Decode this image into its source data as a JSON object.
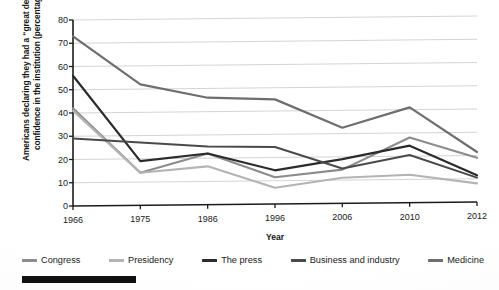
{
  "chart_data": {
    "type": "line",
    "title": "",
    "xlabel": "Year",
    "ylabel": "Americans declaring they had a “great deal” of confidence in the institution (percentage)",
    "categories": [
      "1966",
      "1975",
      "1986",
      "1996",
      "2006",
      "2010",
      "2012"
    ],
    "ylim": [
      0,
      80
    ],
    "ytick_labels": [
      "0",
      "10",
      "20",
      "30",
      "40",
      "50",
      "60",
      "70",
      "80"
    ],
    "yticks": [
      0,
      10,
      20,
      30,
      40,
      50,
      60,
      70,
      80
    ],
    "grid": "horizontal",
    "legend_position": "bottom",
    "series": [
      {
        "name": "Congress",
        "color": "#8c8c8c",
        "values": [
          42,
          14,
          22,
          11.5,
          14.5,
          28,
          19
        ]
      },
      {
        "name": "Presidency",
        "color": "#b4b4b4",
        "values": [
          41,
          14,
          16.5,
          7,
          11,
          12,
          8
        ]
      },
      {
        "name": "The press",
        "color": "#2b2b2b",
        "values": [
          56,
          19,
          22,
          14.5,
          19,
          24.5,
          11.5
        ]
      },
      {
        "name": "Business and industry",
        "color": "#4a4a4a",
        "values": [
          29,
          27,
          25,
          24.5,
          15,
          20.5,
          10.5
        ]
      },
      {
        "name": "Medicine",
        "color": "#6e6e6e",
        "values": [
          73,
          52,
          46,
          45,
          32.5,
          41,
          21.5
        ]
      }
    ]
  },
  "axes": {
    "x_title": "Year",
    "y_title": "Americans declaring they had a “great deal” of confidence in the institution (percentage)"
  },
  "legend": {
    "items": [
      {
        "label": "Congress",
        "color": "#8c8c8c"
      },
      {
        "label": "Presidency",
        "color": "#b4b4b4"
      },
      {
        "label": "The press",
        "color": "#2b2b2b"
      },
      {
        "label": "Business and industry",
        "color": "#4a4a4a"
      },
      {
        "label": "Medicine",
        "color": "#6e6e6e"
      }
    ]
  }
}
